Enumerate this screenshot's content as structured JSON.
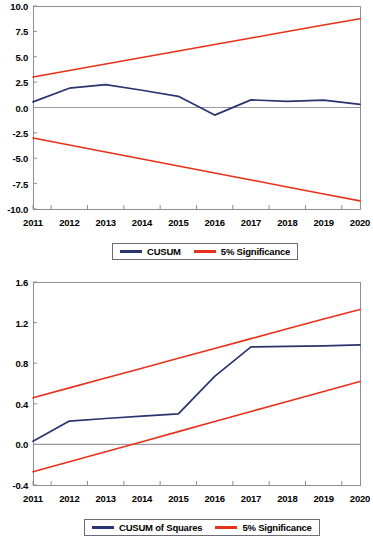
{
  "figure": {
    "panels": 2,
    "background": "#ffffff",
    "series_colors": {
      "cusum": "#2a3470",
      "significance": "#e8311a",
      "axis": "#8d8d96",
      "zero_line": "#9a9aa2",
      "legend_border": "#6b6b7a"
    }
  },
  "chart_data": [
    {
      "type": "line",
      "title": "",
      "xlabel": "",
      "ylabel": "",
      "grid": false,
      "legend_position": "bottom-center",
      "x": [
        2011,
        2012,
        2013,
        2014,
        2015,
        2016,
        2017,
        2018,
        2019,
        2020
      ],
      "xtick_labels": [
        "2011",
        "2012",
        "2013",
        "2014",
        "2015",
        "2016",
        "2017",
        "2018",
        "2019",
        "2020"
      ],
      "ytick_labels": [
        "10.0",
        "7.5",
        "5.0",
        "2.5",
        "0.0",
        "-2.5",
        "-5.0",
        "-7.5",
        "-10.0"
      ],
      "ytick_values": [
        10.0,
        7.5,
        5.0,
        2.5,
        0.0,
        -2.5,
        -5.0,
        -7.5,
        -10.0
      ],
      "ylim": [
        -10.0,
        10.0
      ],
      "xlim": [
        2011,
        2020
      ],
      "series": [
        {
          "name": "CUSUM",
          "color": "#2a3470",
          "values": [
            0.55,
            1.9,
            2.25,
            1.7,
            1.1,
            -0.75,
            0.75,
            0.6,
            0.72,
            0.3
          ]
        },
        {
          "name": "5% Significance",
          "color": "#e8311a",
          "values": [
            3.0,
            3.64,
            4.28,
            4.92,
            5.56,
            6.2,
            6.84,
            7.48,
            8.12,
            8.75
          ]
        },
        {
          "name": "5% Significance",
          "color": "#e8311a",
          "values": [
            -3.0,
            -3.69,
            -4.38,
            -5.07,
            -5.76,
            -6.45,
            -7.14,
            -7.83,
            -8.52,
            -9.2
          ]
        }
      ],
      "legend": [
        {
          "label": "CUSUM",
          "color": "#2a3470"
        },
        {
          "label": "5% Significance",
          "color": "#e8311a"
        }
      ]
    },
    {
      "type": "line",
      "title": "",
      "xlabel": "",
      "ylabel": "",
      "grid": false,
      "legend_position": "bottom-center",
      "x": [
        2011,
        2012,
        2013,
        2014,
        2015,
        2016,
        2017,
        2018,
        2019,
        2020
      ],
      "xtick_labels": [
        "2011",
        "2012",
        "2013",
        "2014",
        "2015",
        "2016",
        "2017",
        "2018",
        "2019",
        "2020"
      ],
      "ytick_labels": [
        "1.6",
        "1.2",
        "0.8",
        "0.4",
        "0.0",
        "-0.4"
      ],
      "ytick_values": [
        1.6,
        1.2,
        0.8,
        0.4,
        0.0,
        -0.4
      ],
      "ylim": [
        -0.4,
        1.6
      ],
      "xlim": [
        2011,
        2020
      ],
      "series": [
        {
          "name": "CUSUM of Squares",
          "color": "#2a3470",
          "values": [
            0.03,
            0.23,
            0.255,
            0.278,
            0.3,
            0.67,
            0.96,
            0.965,
            0.97,
            0.98
          ]
        },
        {
          "name": "5% Significance",
          "color": "#e8311a",
          "values": [
            0.46,
            0.557,
            0.654,
            0.751,
            0.848,
            0.945,
            1.042,
            1.139,
            1.236,
            1.33
          ]
        },
        {
          "name": "5% Significance",
          "color": "#e8311a",
          "values": [
            -0.27,
            -0.171,
            -0.072,
            0.027,
            0.126,
            0.225,
            0.324,
            0.423,
            0.522,
            0.62
          ]
        }
      ],
      "legend": [
        {
          "label": "CUSUM of Squares",
          "color": "#2a3470"
        },
        {
          "label": "5% Significance",
          "color": "#e8311a"
        }
      ]
    }
  ]
}
